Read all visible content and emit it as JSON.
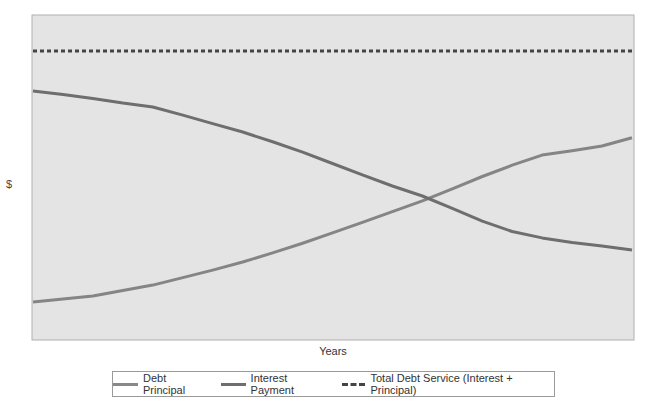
{
  "chart_data": {
    "type": "line",
    "title": "",
    "xlabel": "Years",
    "ylabel": "$",
    "x": [
      0,
      1,
      2,
      3,
      4,
      5,
      6,
      7,
      8,
      9,
      10,
      11,
      12,
      13,
      14,
      15,
      16,
      17,
      18,
      19,
      20
    ],
    "ylim": [
      0,
      100
    ],
    "grid": false,
    "legend_position": "bottom",
    "series": [
      {
        "name": "Debt Principal",
        "style": "solid",
        "color": "#858585",
        "values": [
          11.7,
          12.6,
          13.5,
          15.2,
          16.9,
          19.2,
          21.5,
          24.0,
          26.8,
          29.8,
          33.0,
          36.2,
          39.5,
          42.8,
          46.5,
          50.3,
          53.8,
          56.9,
          58.2,
          59.7,
          62.2
        ]
      },
      {
        "name": "Interest Payment",
        "style": "solid",
        "color": "#6e6e6e",
        "values": [
          76.6,
          75.5,
          74.3,
          72.9,
          71.7,
          69.2,
          66.6,
          64.0,
          61.0,
          57.8,
          54.3,
          50.8,
          47.4,
          44.3,
          40.5,
          36.6,
          33.4,
          31.4,
          30.0,
          28.9,
          27.7
        ]
      },
      {
        "name": "Total Debt Service (Interest + Principal)",
        "style": "dotted",
        "color": "#444444",
        "values": [
          88.9,
          88.9,
          88.9,
          88.9,
          88.9,
          88.9,
          88.9,
          88.9,
          88.9,
          88.9,
          88.9,
          88.9,
          88.9,
          88.9,
          88.9,
          88.9,
          88.9,
          88.9,
          88.9,
          88.9,
          88.9
        ]
      }
    ]
  },
  "labels": {
    "x": "Years",
    "y": "$"
  },
  "legend": [
    {
      "label": "Debt Principal"
    },
    {
      "label": "Interest Payment"
    },
    {
      "label": "Total Debt Service (Interest + Principal)"
    }
  ],
  "colors": {
    "plot_bg": "#e4e4e4",
    "plot_border": "#b0b0b0"
  }
}
